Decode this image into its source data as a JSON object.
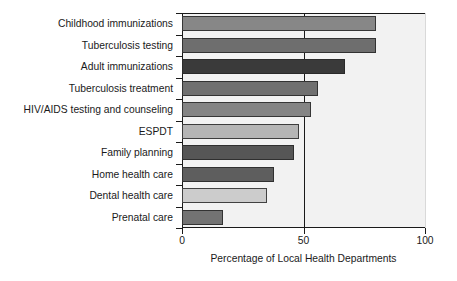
{
  "chart_data": {
    "type": "bar",
    "orientation": "horizontal",
    "title": "",
    "xlabel": "Percentage of Local Health Departments",
    "ylabel": "",
    "xlim": [
      0,
      100
    ],
    "xticks": [
      0,
      50,
      100
    ],
    "xticklabels": [
      "0",
      "50",
      "100"
    ],
    "grid": "vertical-at-50",
    "legend": "none",
    "categories": [
      "Childhood immunizations",
      "Tuberculosis testing",
      "Adult immunizations",
      "Tuberculosis treatment",
      "HIV/AIDS testing and counseling",
      "ESPDT",
      "Family planning",
      "Home health care",
      "Dental health care",
      "Prenatal care"
    ],
    "values": [
      80,
      80,
      67,
      56,
      53,
      48,
      46,
      38,
      35,
      17
    ],
    "bar_colors": [
      "#878787",
      "#6e6e6e",
      "#3a3a3a",
      "#707070",
      "#848484",
      "#b5b5b5",
      "#565656",
      "#5e5e5e",
      "#cccccc",
      "#737373"
    ],
    "plot_background": "#f2f2f2",
    "axis_color": "#1a1a1a"
  }
}
